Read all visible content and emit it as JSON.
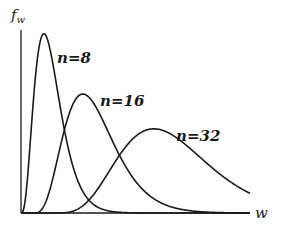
{
  "chart_data": {
    "type": "line",
    "title": "",
    "xlabel": "w",
    "ylabel": "f_w",
    "ylabel_main": "f",
    "ylabel_sub": "w",
    "grid": false,
    "legend": "inline labels",
    "xlim": [
      0,
      1
    ],
    "ylim": [
      0,
      1
    ],
    "series": [
      {
        "name": "n=8",
        "label": "n=8",
        "peak_x": 0.1,
        "peak_y": 0.98,
        "start_x": 0.0,
        "shape": 3.0,
        "label_pos": [
          57,
          63
        ]
      },
      {
        "name": "n=16",
        "label": "n=16",
        "peak_x": 0.27,
        "peak_y": 0.65,
        "start_x": 0.05,
        "shape": 4.0,
        "label_pos": [
          100,
          106
        ]
      },
      {
        "name": "n=32",
        "label": "n=32",
        "peak_x": 0.58,
        "peak_y": 0.46,
        "start_x": 0.12,
        "shape": 5.5,
        "label_pos": [
          176,
          141
        ]
      }
    ],
    "annotations": [
      "n=8",
      "n=16",
      "n=32"
    ]
  },
  "colors": {
    "line": "#1a1a1a",
    "background": "#ffffff"
  },
  "plot_area": {
    "x0": 21,
    "y0": 213,
    "x1": 250,
    "ytop": 30
  }
}
